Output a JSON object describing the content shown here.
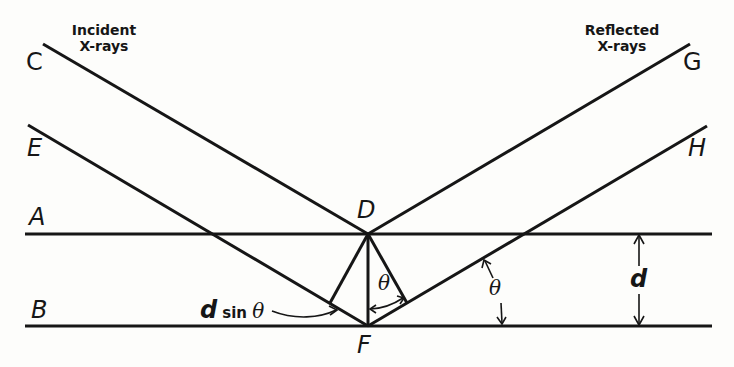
{
  "diagram": {
    "captions": {
      "incident": [
        "Incident",
        "X-rays"
      ],
      "reflected": [
        "Reflected",
        "X-rays"
      ]
    },
    "points": {
      "A": "A",
      "B": "B",
      "C": "C",
      "D": "D",
      "E": "E",
      "F": "F",
      "G": "G",
      "H": "H"
    },
    "annotations": {
      "path_difference_d": "d",
      "path_difference_sin": "sin",
      "path_difference_theta": "θ",
      "theta_at_F": "θ",
      "theta_at_plane": "θ",
      "spacing": "d"
    },
    "colors": {
      "ink": "#161616",
      "background": "#fdfdfb"
    }
  }
}
